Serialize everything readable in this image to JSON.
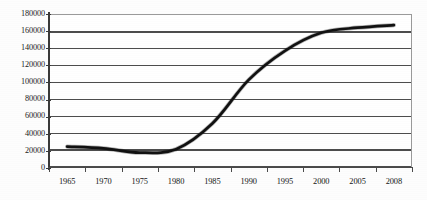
{
  "chart_data": {
    "type": "line",
    "title": "",
    "subtitle": "",
    "xlabel": "",
    "ylabel": "",
    "grid": true,
    "legend": false,
    "legend_position": "none",
    "series_color": "#111111",
    "axis_color": "#3a3a3a",
    "grid_color": "#4d4d4d",
    "plot_background": "#ffffff",
    "xlim": [
      1963.5,
      2009.5
    ],
    "ylim": [
      0,
      180000
    ],
    "ytick_labels": [
      "180000",
      "160000",
      "140000",
      "120000",
      "100000",
      "80000",
      "60000",
      "40000",
      "20000",
      "0"
    ],
    "ytick_values": [
      180000,
      160000,
      140000,
      120000,
      100000,
      80000,
      60000,
      40000,
      20000,
      0
    ],
    "xtick_labels": [
      "1965",
      "1970",
      "1975",
      "1980",
      "1985",
      "1990",
      "1995",
      "2000",
      "2005",
      "2008"
    ],
    "categories": [
      1965,
      1970,
      1975,
      1980,
      1985,
      1990,
      1995,
      2000,
      2005,
      2008
    ],
    "series": [
      {
        "name": "value",
        "x": [
          1965,
          1970,
          1975,
          1980,
          1985,
          1990,
          1995,
          2000,
          2005,
          2008
        ],
        "values": [
          25000,
          23000,
          18000,
          22000,
          52000,
          103000,
          137000,
          158000,
          164000,
          167000
        ]
      }
    ],
    "x": [
      1965,
      1970,
      1975,
      1980,
      1985,
      1990,
      1995,
      2000,
      2005,
      2008
    ],
    "values": [
      25000,
      23000,
      18000,
      22000,
      52000,
      103000,
      137000,
      158000,
      164000,
      167000
    ]
  }
}
